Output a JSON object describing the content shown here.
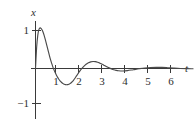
{
  "chart_data": {
    "type": "line",
    "title": "",
    "subtitle": "",
    "xlabel": "t",
    "ylabel": "x",
    "grid": false,
    "legend": false,
    "xlim": [
      -0.25,
      6.9
    ],
    "ylim": [
      -1.45,
      1.35
    ],
    "xticks": [
      1,
      2,
      3,
      4,
      5,
      6
    ],
    "xticklabels": [
      "1",
      "2",
      "3",
      "4",
      "5",
      "6"
    ],
    "yticks": [
      1,
      -1
    ],
    "yticklabels": [
      "1",
      "−1"
    ],
    "annotations": [],
    "series": [
      {
        "name": "damped oscillation",
        "color": "#4a4a4a",
        "x": [
          0.0,
          0.05,
          0.1,
          0.15,
          0.2,
          0.25,
          0.3,
          0.35,
          0.4,
          0.45,
          0.5,
          0.55,
          0.6,
          0.65,
          0.7,
          0.75,
          0.8,
          0.85,
          0.9,
          0.95,
          1.0,
          1.05,
          1.1,
          1.15,
          1.2,
          1.25,
          1.3,
          1.35,
          1.4,
          1.45,
          1.5,
          1.55,
          1.6,
          1.65,
          1.7,
          1.75,
          1.8,
          1.85,
          1.9,
          1.95,
          2.0,
          2.1,
          2.2,
          2.3,
          2.4,
          2.5,
          2.6,
          2.7,
          2.8,
          2.9,
          3.0,
          3.1,
          3.2,
          3.3,
          3.4,
          3.5,
          3.6,
          3.8,
          4.0,
          4.25,
          4.5,
          4.75,
          5.0,
          5.25,
          5.5,
          5.75,
          6.0,
          6.3,
          6.6,
          6.85
        ],
        "y": [
          0.0,
          0.56,
          0.88,
          1.03,
          1.07,
          1.05,
          1.0,
          0.92,
          0.82,
          0.71,
          0.59,
          0.47,
          0.35,
          0.24,
          0.14,
          0.05,
          -0.03,
          -0.1,
          -0.165,
          -0.22,
          -0.27,
          -0.31,
          -0.345,
          -0.375,
          -0.398,
          -0.415,
          -0.425,
          -0.428,
          -0.425,
          -0.415,
          -0.398,
          -0.375,
          -0.345,
          -0.31,
          -0.27,
          -0.225,
          -0.18,
          -0.135,
          -0.09,
          -0.048,
          -0.01,
          0.055,
          0.11,
          0.15,
          0.175,
          0.185,
          0.18,
          0.165,
          0.14,
          0.11,
          0.078,
          0.046,
          0.016,
          -0.01,
          -0.032,
          -0.048,
          -0.058,
          -0.065,
          -0.055,
          -0.032,
          -0.008,
          0.012,
          0.025,
          0.03,
          0.028,
          0.02,
          0.01,
          0.0,
          -0.005,
          -0.006
        ]
      }
    ]
  },
  "figure": {
    "y_axis_name": "x",
    "x_axis_name": "t",
    "background_color": "#ffffff",
    "axis_color": "#3a3a3a",
    "curve_color": "#4a4a4a"
  }
}
